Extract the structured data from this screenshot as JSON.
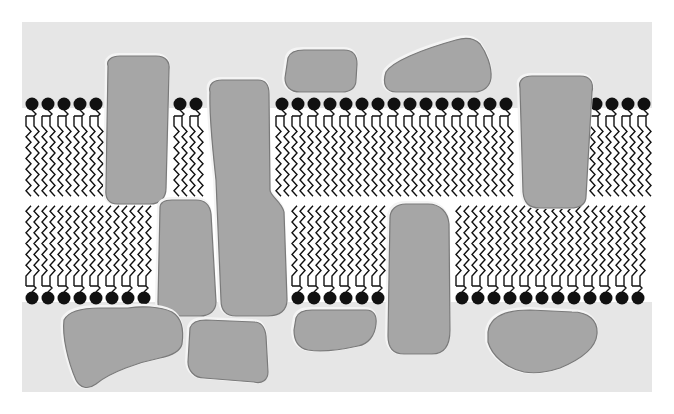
{
  "diagram": {
    "type": "fluid-mosaic-cell-membrane",
    "colors": {
      "page_bg": "#ffffff",
      "aqueous_bg": "#e6e6e6",
      "bilayer_core": "#ffffff",
      "protein_fill": "#a6a6a6",
      "protein_stroke": "#7a7a7a",
      "protein_highlight": "#f4f4f4",
      "lipid": "#111111"
    },
    "regions": {
      "aqueous": {
        "x": 22,
        "y": 22,
        "w": 630,
        "h": 370
      },
      "bilayer": {
        "y_top": 108,
        "y_bottom": 302
      }
    },
    "lipids": {
      "spacing": 16,
      "top_head_y": 104,
      "bottom_head_y": 298,
      "top_heads_x": [
        32,
        48,
        64,
        80,
        96,
        180,
        196,
        282,
        298,
        314,
        330,
        346,
        362,
        378,
        394,
        410,
        426,
        442,
        458,
        474,
        490,
        506,
        596,
        612,
        628,
        644
      ],
      "bottom_heads_x": [
        32,
        48,
        64,
        80,
        96,
        112,
        128,
        144,
        298,
        314,
        330,
        346,
        362,
        378,
        462,
        478,
        494,
        510,
        526,
        542,
        558,
        574,
        590,
        606,
        622,
        638
      ]
    },
    "proteins": [
      {
        "id": "integral-left-tall",
        "kind": "integral",
        "path": "M108,66 C106,60 112,56 120,56 L156,56 C166,56 170,62 169,70 L166,188 C166,198 160,204 150,204 L118,204 C108,204 105,198 106,188 Z"
      },
      {
        "id": "integral-center-long",
        "kind": "integral",
        "path": "M210,92 C208,84 214,80 222,80 L258,80 C266,80 269,86 269,94 L270,190 C270,196 282,202 284,212 L287,300 C287,310 280,316 268,316 L236,316 C226,316 221,310 221,300 L216,180 C214,160 209,120 210,92 Z"
      },
      {
        "id": "integral-lower-left",
        "kind": "integral",
        "path": "M160,208 C160,202 166,200 172,200 L196,200 C206,200 210,206 211,214 L216,302 C216,310 210,316 200,316 L170,316 C162,316 158,310 158,302 Z"
      },
      {
        "id": "peripheral-top-small",
        "kind": "peripheral",
        "path": "M288,58 C290,52 296,50 304,50 L344,50 C354,50 357,56 357,64 L356,80 C356,88 350,92 342,92 L300,92 C290,92 285,86 285,78 Z"
      },
      {
        "id": "peripheral-top-wedge",
        "kind": "peripheral",
        "path": "M386,72 C392,62 420,50 456,40 C466,37 474,38 480,44 C486,52 492,66 491,78 C490,86 484,92 474,92 L396,92 C386,92 382,84 386,72 Z"
      },
      {
        "id": "integral-right",
        "kind": "integral",
        "path": "M520,88 C518,80 524,76 532,76 L580,76 C590,76 594,82 592,92 L586,196 C586,204 580,208 570,208 L540,208 C528,208 524,202 523,192 Z"
      },
      {
        "id": "integral-center-right",
        "kind": "integral",
        "path": "M390,218 C390,210 396,204 406,204 L428,204 C440,204 448,212 449,224 L450,330 C450,346 444,354 432,354 L404,354 C394,354 388,348 388,336 Z"
      },
      {
        "id": "peripheral-bottom-large",
        "kind": "peripheral",
        "path": "M64,320 C68,312 80,308 100,308 L128,308 C140,306 160,306 172,312 C182,318 184,330 182,344 C180,352 170,356 160,358 C140,362 110,372 96,384 C88,390 80,388 76,380 C68,362 62,336 64,320 Z"
      },
      {
        "id": "peripheral-bottom-center",
        "kind": "peripheral",
        "path": "M190,328 C192,322 198,320 206,320 L254,322 C262,322 265,328 266,336 L268,372 C268,380 262,384 254,382 L204,378 C194,378 188,370 188,362 Z"
      },
      {
        "id": "peripheral-bottom-mid",
        "kind": "peripheral",
        "path": "M296,318 C298,312 304,310 312,310 L366,310 C374,310 377,316 376,324 C375,336 368,344 358,346 C340,350 320,352 308,350 C298,348 294,340 294,330 Z"
      },
      {
        "id": "peripheral-bottom-right",
        "kind": "peripheral",
        "path": "M488,332 C490,318 504,310 530,310 L572,312 C588,312 598,320 597,334 C596,346 584,358 560,368 C548,372 536,374 524,372 C506,368 492,356 488,342 Z"
      }
    ]
  }
}
